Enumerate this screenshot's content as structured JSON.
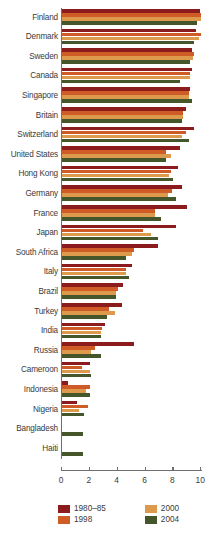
{
  "chart_data": {
    "type": "bar",
    "orientation": "horizontal",
    "title": "",
    "subtitle": "",
    "xlabel": "",
    "ylabel": "",
    "xlim": [
      0,
      11.2
    ],
    "xticks": [
      0,
      2,
      4,
      6,
      8,
      10
    ],
    "xticklabels": [
      "0",
      "2",
      "4",
      "6",
      "8",
      "10"
    ],
    "grid": false,
    "legend_position": "bottom",
    "series": [
      {
        "name": "1980–85",
        "color": "#8c1b1e",
        "values": [
          9.9,
          9.6,
          9.3,
          9.3,
          9.2,
          8.9,
          9.5,
          8.5,
          8.3,
          8.6,
          9.0,
          8.2,
          6.9,
          5.0,
          4.4,
          4.3,
          3.1,
          5.2,
          2.0,
          0.4,
          1.1,
          0,
          0
        ]
      },
      {
        "name": "1998",
        "color": "#cf5c26",
        "values": [
          10.0,
          10.0,
          9.5,
          9.2,
          9.1,
          8.7,
          8.9,
          7.5,
          7.8,
          7.9,
          6.7,
          5.8,
          5.2,
          4.6,
          4.0,
          3.4,
          2.9,
          2.4,
          1.4,
          2.0,
          1.9,
          0,
          0
        ]
      },
      {
        "name": "2000",
        "color": "#dd9a4c",
        "values": [
          10.0,
          9.8,
          9.4,
          9.2,
          9.1,
          8.7,
          8.6,
          7.8,
          7.7,
          7.6,
          6.7,
          6.4,
          5.0,
          4.6,
          3.9,
          3.8,
          2.8,
          2.1,
          2.0,
          1.7,
          1.2,
          0,
          0
        ]
      },
      {
        "name": "2004",
        "color": "#45562a",
        "values": [
          9.7,
          9.5,
          9.2,
          8.5,
          9.3,
          8.6,
          9.1,
          7.5,
          8.0,
          8.2,
          7.1,
          6.9,
          4.6,
          4.8,
          3.9,
          3.2,
          2.8,
          2.8,
          2.1,
          2.0,
          1.6,
          1.5,
          1.5
        ]
      }
    ],
    "categories": [
      "Finland",
      "Denmark",
      "Sweden",
      "Canada",
      "Singapore",
      "Britain",
      "Switzerland",
      "United States",
      "Hong Kong",
      "Germany",
      "France",
      "Japan",
      "South Africa",
      "Italy",
      "Brazil",
      "Turkey",
      "India",
      "Russia",
      "Cameroon",
      "Indonesia",
      "Nigeria",
      "Bangladesh",
      "Haiti"
    ]
  },
  "legend": {
    "items": [
      {
        "label": "1980–85",
        "color": "#8c1b1e"
      },
      {
        "label": "2000",
        "color": "#dd9a4c"
      },
      {
        "label": "1998",
        "color": "#cf5c26"
      },
      {
        "label": "2004",
        "color": "#45562a"
      }
    ]
  }
}
